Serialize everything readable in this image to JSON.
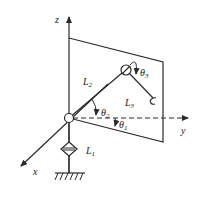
{
  "diagram": {
    "type": "robot-arm-kinematics",
    "axes": {
      "x": {
        "label": "x"
      },
      "y": {
        "label": "y"
      },
      "z": {
        "label": "z"
      }
    },
    "links": [
      {
        "id": "L1",
        "base": "L",
        "sub": "1"
      },
      {
        "id": "L2",
        "base": "L",
        "sub": "2"
      },
      {
        "id": "L3",
        "base": "L",
        "sub": "3"
      }
    ],
    "angles": [
      {
        "id": "theta1",
        "base": "θ",
        "sub": "1"
      },
      {
        "id": "theta2",
        "base": "θ",
        "sub": "2"
      },
      {
        "id": "theta3",
        "base": "θ",
        "sub": "3"
      }
    ],
    "colors": {
      "stroke": "#2a2a2a",
      "background": "#ffffff"
    }
  }
}
